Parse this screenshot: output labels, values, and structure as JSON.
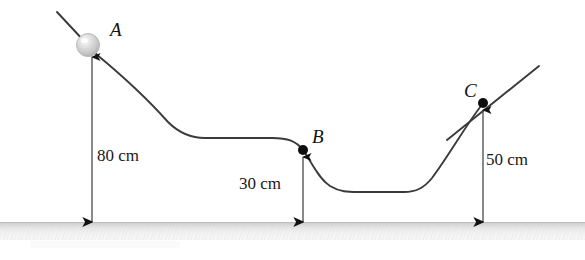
{
  "figure": {
    "type": "physics-track-diagram",
    "background_color": "#ffffff",
    "line_color": "#3a3a3a",
    "ground_color": "#e9e9e9",
    "ball_color": "#cfcfcf"
  },
  "points": [
    {
      "id": "A",
      "label": "A",
      "label_x": 110,
      "label_y": 36,
      "marker": "ball",
      "x": 88,
      "y": 45,
      "radius": 11
    },
    {
      "id": "B",
      "label": "B",
      "label_x": 312,
      "label_y": 143,
      "marker": "dot",
      "x": 303,
      "y": 150,
      "radius": 5
    },
    {
      "id": "C",
      "label": "C",
      "label_x": 464,
      "label_y": 97,
      "marker": "dot",
      "x": 483,
      "y": 103,
      "radius": 5
    }
  ],
  "measurements": [
    {
      "id": "height-A",
      "label": "80 cm",
      "value": 80,
      "unit": "cm",
      "point": "A",
      "label_x": 97,
      "label_y": 161,
      "arrow_x": 92,
      "arrow_top": 57,
      "arrow_bottom": 222,
      "arrowheads": "both"
    },
    {
      "id": "height-B",
      "label": "30 cm",
      "value": 30,
      "unit": "cm",
      "point": "B",
      "label_x": 239,
      "label_y": 189,
      "arrow_x": 303,
      "arrow_top": 157,
      "arrow_bottom": 222,
      "arrowheads": "both"
    },
    {
      "id": "height-C",
      "label": "50 cm",
      "value": 50,
      "unit": "cm",
      "point": "C",
      "label_x": 486,
      "label_y": 165,
      "arrow_x": 483,
      "arrow_top": 110,
      "arrow_bottom": 222,
      "arrowheads": "both"
    }
  ],
  "ground": {
    "id": "ground-line",
    "top_y": 222,
    "height": 18,
    "left_x": 0,
    "right_x": 585
  },
  "track": {
    "incline_left": {
      "x1": 57,
      "y1": 12,
      "x2": 98,
      "y2": 56
    },
    "incline_right": {
      "x1": 447,
      "y1": 140,
      "x2": 539,
      "y2": 66
    },
    "path": "M 96 54 C 130 82 152 104 168 122 C 180 134 192 138 205 138 L 272 138 C 288 138 296 141 303 150 C 311 161 318 178 330 186 C 340 192 348 192 358 192 L 404 192 C 416 192 424 188 432 178 C 448 157 466 125 481 106"
  }
}
